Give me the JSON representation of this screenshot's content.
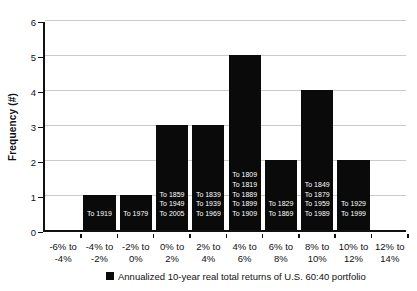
{
  "chart_data": {
    "type": "bar",
    "ylabel": "Frequency (#)",
    "xlabel": "",
    "title": "",
    "ylim": [
      0,
      6
    ],
    "ytick_labels": [
      "0",
      "1",
      "2",
      "3",
      "4",
      "5",
      "6"
    ],
    "grid": true,
    "gridline_color": "#cbcbcb",
    "bar_color": "#0a0a0a",
    "categories": [
      [
        "-6% to",
        "-4%"
      ],
      [
        "-4% to",
        "-2%"
      ],
      [
        "-2% to",
        "0%"
      ],
      [
        "0% to",
        "2%"
      ],
      [
        "2% to",
        "4%"
      ],
      [
        "4% to",
        "6%"
      ],
      [
        "6% to",
        "8%"
      ],
      [
        "8% to",
        "10%"
      ],
      [
        "10% to",
        "12%"
      ],
      [
        "12% to",
        "14%"
      ]
    ],
    "values": [
      0,
      1,
      1,
      3,
      3,
      5,
      2,
      4,
      2,
      0
    ],
    "bar_labels": [
      [],
      [
        "To 1919"
      ],
      [
        "To 1979"
      ],
      [
        "To 1859",
        "To 1949",
        "To 2005"
      ],
      [
        "To 1839",
        "To 1939",
        "To 1969"
      ],
      [
        "To 1809",
        "To 1819",
        "To 1889",
        "To 1899",
        "To 1909"
      ],
      [
        "To 1829",
        "To 1869"
      ],
      [
        "To 1849",
        "To 1879",
        "To 1959",
        "To 1989"
      ],
      [
        "To 1929",
        "To 1999"
      ],
      []
    ],
    "legend": {
      "marker_color": "#0a0a0a",
      "label": "Annualized 10-year real total returns of U.S. 60:40 portfolio"
    }
  }
}
